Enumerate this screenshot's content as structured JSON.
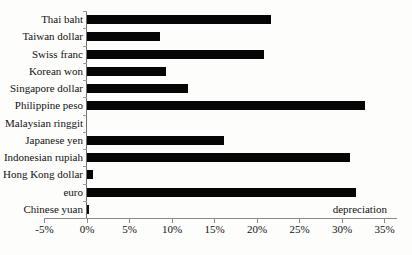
{
  "chart_data": {
    "type": "bar",
    "orientation": "horizontal",
    "title": "",
    "xlabel": "depreciation",
    "ylabel": "",
    "categories": [
      "Thai baht",
      "Taiwan dollar",
      "Swiss franc",
      "Korean won",
      "Singapore dollar",
      "Philippine peso",
      "Malaysian ringgit",
      "Japanese yen",
      "Indonesian rupiah",
      "Hong Kong dollar",
      "euro",
      "Chinese yuan"
    ],
    "values": [
      21.7,
      8.6,
      20.8,
      9.3,
      11.9,
      32.7,
      0,
      16.1,
      30.9,
      0.7,
      31.7,
      0.2
    ],
    "value_unit": "%",
    "x_tick_labels": [
      "-5%",
      "0%",
      "5%",
      "10%",
      "15%",
      "20%",
      "25%",
      "30%",
      "35%"
    ],
    "x_tick_values": [
      -5,
      0,
      5,
      10,
      15,
      20,
      25,
      30,
      35
    ],
    "xlim": [
      -5,
      36.5
    ],
    "grid": false,
    "legend": false,
    "bar_color": "#050505",
    "annotation": "depreciation"
  }
}
